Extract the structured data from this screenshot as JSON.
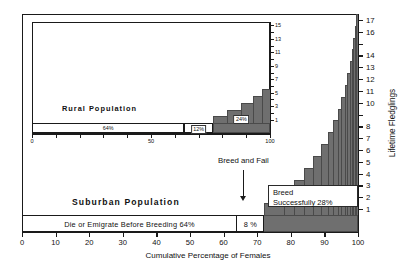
{
  "chart_data": {
    "type": "bar",
    "title": "",
    "xlabel": "Cumulative Percentage of Females",
    "ylabel": "Lifetime Fledglings",
    "xlim": [
      0,
      100
    ],
    "ylim": [
      0,
      17
    ],
    "grid": false,
    "legend": "none",
    "panels": [
      {
        "name": "main",
        "panel_label": "Suburban  Population",
        "xticks": [
          0,
          10,
          20,
          30,
          40,
          50,
          60,
          70,
          80,
          90,
          100
        ],
        "yticks": [
          1,
          2,
          3,
          4,
          5,
          6,
          7,
          8,
          10,
          11,
          12,
          13,
          14,
          16,
          17
        ],
        "segments": [
          {
            "label": "Die or Emigrate Before Breeding  64%",
            "value": 64,
            "fledglings": 0,
            "fill": "white"
          },
          {
            "label": "8 %",
            "value": 8,
            "fledglings": 0,
            "fill": "white"
          },
          {
            "label": "Breed Successfully  28%",
            "value": 28,
            "fledglings": 1,
            "fill": "grey"
          }
        ],
        "staircase": [
          {
            "from": 72,
            "to": 100,
            "fledglings": 1
          },
          {
            "from": 78,
            "to": 100,
            "fledglings": 2
          },
          {
            "from": 81,
            "to": 100,
            "fledglings": 3
          },
          {
            "from": 84,
            "to": 100,
            "fledglings": 4
          },
          {
            "from": 86.5,
            "to": 100,
            "fledglings": 5
          },
          {
            "from": 89,
            "to": 100,
            "fledglings": 6
          },
          {
            "from": 91,
            "to": 100,
            "fledglings": 7
          },
          {
            "from": 92.5,
            "to": 100,
            "fledglings": 8
          },
          {
            "from": 94,
            "to": 100,
            "fledglings": 9
          },
          {
            "from": 95,
            "to": 100,
            "fledglings": 10
          },
          {
            "from": 96,
            "to": 100,
            "fledglings": 11
          },
          {
            "from": 96.8,
            "to": 100,
            "fledglings": 12
          },
          {
            "from": 97.5,
            "to": 100,
            "fledglings": 13
          },
          {
            "from": 98.1,
            "to": 100,
            "fledglings": 14
          },
          {
            "from": 98.6,
            "to": 100,
            "fledglings": 15
          },
          {
            "from": 99.1,
            "to": 100,
            "fledglings": 16
          },
          {
            "from": 99.5,
            "to": 100,
            "fledglings": 17
          }
        ],
        "annotation": "Breed and Fail",
        "callout": {
          "line1": "Breed",
          "line2": "Successfully  28%"
        }
      },
      {
        "name": "inset",
        "panel_label": "Rural  Population",
        "xticks": [
          0,
          50,
          100
        ],
        "yticks": [
          1,
          3,
          5,
          7,
          9,
          11,
          13,
          15
        ],
        "segments": [
          {
            "label": "64%",
            "value": 64,
            "fill": "white"
          },
          {
            "label": "12%",
            "value": 12,
            "fill": "white"
          },
          {
            "label": "24%",
            "value": 24,
            "fill": "grey"
          }
        ],
        "staircase": [
          {
            "from": 76,
            "to": 100,
            "fledglings": 1
          },
          {
            "from": 82,
            "to": 100,
            "fledglings": 2
          },
          {
            "from": 88,
            "to": 100,
            "fledglings": 3
          },
          {
            "from": 93,
            "to": 100,
            "fledglings": 4
          },
          {
            "from": 96.5,
            "to": 100,
            "fledglings": 5
          }
        ]
      }
    ]
  },
  "colors": {
    "bar_fill": "#6f6f6f",
    "outline": "#1a1a1a",
    "background": "#ffffff"
  }
}
